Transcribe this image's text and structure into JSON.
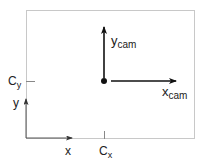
{
  "diagram": {
    "type": "camera-coordinate-frame",
    "frame": {
      "x": 26,
      "y": 10,
      "width": 168,
      "height": 128,
      "stroke": "#c8c8c8"
    },
    "image_axes": {
      "origin": {
        "x": 26,
        "y": 138
      },
      "x_axis": {
        "label": "x",
        "tip": {
          "x": 72,
          "y": 138
        }
      },
      "y_axis": {
        "label": "y",
        "tip": {
          "x": 26,
          "y": 99
        }
      }
    },
    "principal_point": {
      "dot": {
        "x": 104,
        "y": 81
      },
      "cx_label": "C",
      "cx_sub": "x",
      "cy_label": "C",
      "cy_sub": "y"
    },
    "camera_axes": {
      "x_cam": {
        "label": "x",
        "sub": "cam",
        "tip": {
          "x": 176,
          "y": 81
        }
      },
      "y_cam": {
        "label": "y",
        "sub": "cam",
        "tip": {
          "x": 104,
          "y": 26
        }
      }
    },
    "colors": {
      "ink": "#111111",
      "frame": "#c8c8c8",
      "tick": "#888888"
    }
  }
}
